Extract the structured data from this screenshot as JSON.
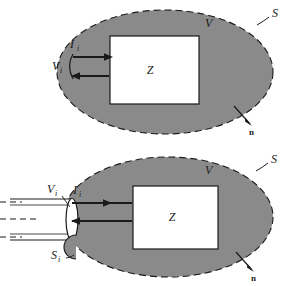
{
  "figure": {
    "background_color": "#ffffff",
    "volume_fill_color": "#8a8a8a",
    "box_fill_color": "#ffffff",
    "line_color": "#1a1a1a",
    "panels": [
      {
        "id": "top",
        "caption": "",
        "labels": {
          "volume": "V",
          "surface": "S",
          "network": "Z",
          "current": "I",
          "current_sub": "i",
          "voltage": "V",
          "voltage_sub": "i",
          "normal": "n"
        }
      },
      {
        "id": "bottom",
        "caption": "",
        "labels": {
          "volume": "V",
          "surface": "S",
          "network": "Z",
          "current": "I",
          "current_sub": "i",
          "voltage": "V",
          "voltage_sub": "i",
          "port_surface": "S",
          "port_surface_sub": "i",
          "normal": "n"
        }
      }
    ]
  }
}
